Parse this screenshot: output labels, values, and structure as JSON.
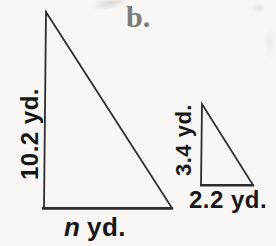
{
  "figure": {
    "part_label": "b.",
    "large_triangle": {
      "height_label": "10.2 yd.",
      "base_variable": "n",
      "base_unit": "yd."
    },
    "small_triangle": {
      "height_label": "3.4 yd.",
      "base_label": "2.2 yd."
    }
  },
  "colors": {
    "background": "#f7f6f4",
    "line": "#2e2e2e",
    "text": "#171717",
    "part_label_gray": "#7b7b7b"
  }
}
